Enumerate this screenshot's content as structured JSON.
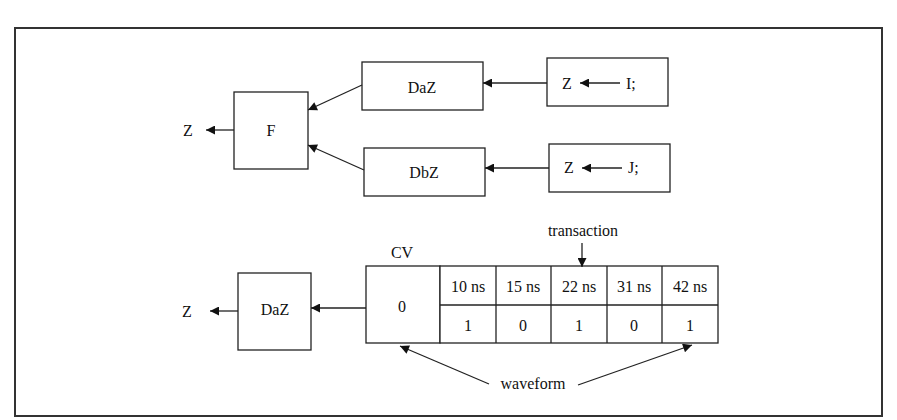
{
  "diagram": {
    "top": {
      "output_label": "Z",
      "resolver": "F",
      "drivers": [
        {
          "name": "DaZ",
          "process_title": "process A",
          "stmt_target": "Z",
          "stmt_source": "I;"
        },
        {
          "name": "DbZ",
          "process_title": "process B",
          "stmt_target": "Z",
          "stmt_source": "J;"
        }
      ]
    },
    "bottom": {
      "output_label": "Z",
      "driver": "DaZ",
      "current_value_label": "CV",
      "current_value": "0",
      "transaction_label": "transaction",
      "waveform_label": "waveform",
      "transactions": [
        {
          "time": "10 ns",
          "value": "1"
        },
        {
          "time": "15 ns",
          "value": "0"
        },
        {
          "time": "22 ns",
          "value": "1"
        },
        {
          "time": "31 ns",
          "value": "0"
        },
        {
          "time": "42 ns",
          "value": "1"
        }
      ]
    }
  }
}
